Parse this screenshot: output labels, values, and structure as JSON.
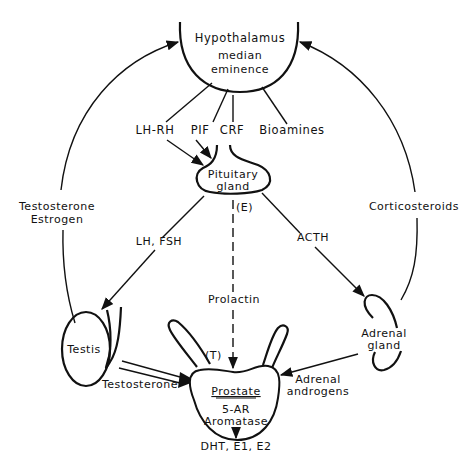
{
  "diagram": {
    "type": "hormonal-regulation-flow",
    "colors": {
      "line": "#111111",
      "background": "#ffffff"
    },
    "nodes": {
      "hypothalamus": {
        "title": "Hypothalamus",
        "sub1": "median",
        "sub2": "eminence"
      },
      "pituitary": {
        "line1": "Pituitary",
        "line2": "gland"
      },
      "testis": {
        "label": "Testis"
      },
      "adrenal": {
        "line1": "Adrenal",
        "line2": "gland"
      },
      "prostate": {
        "title": "Prostate",
        "enzyme1": "5-AR",
        "enzyme2": "Aromatase",
        "products": "DHT, E1, E2",
        "marker": "(T)"
      }
    },
    "signals": {
      "lhrh": "LH-RH",
      "pif": "PIF",
      "crf": "CRF",
      "bioamines": "Bioamines",
      "lh_fsh": "LH, FSH",
      "acth": "ACTH",
      "prolactin": "Prolactin",
      "estrogen_marker": "(E)",
      "feedback_left_1": "Testosterone",
      "feedback_left_2": "Estrogen",
      "feedback_right": "Corticosteroids",
      "testosterone": "Testosterone",
      "adrenal_androgens_1": "Adrenal",
      "adrenal_androgens_2": "androgens"
    }
  }
}
